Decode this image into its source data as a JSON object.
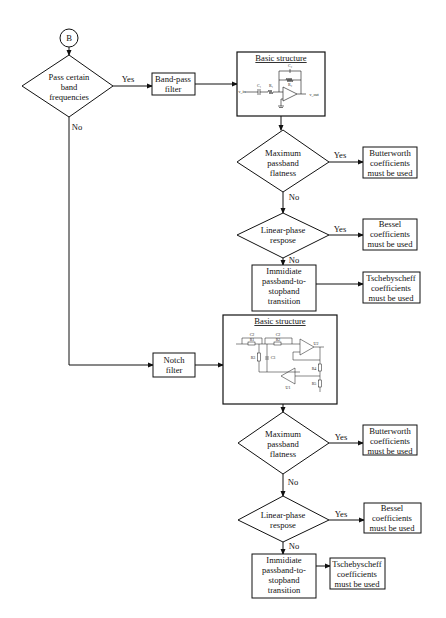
{
  "start_connector": {
    "label": "B"
  },
  "decision_main": {
    "lines": [
      "Pass certain",
      "band",
      "frequencies"
    ],
    "yes": "Yes",
    "no": "No"
  },
  "bandpass": {
    "filter": {
      "lines": [
        "Band-pass",
        "filter"
      ]
    },
    "structure": {
      "title": "Basic structure",
      "labels": {
        "c2": "C₂",
        "r2": "R₂",
        "c1": "C₁",
        "r1": "R₁",
        "vin": "v_in",
        "vout": "v_out"
      }
    },
    "decision_flat": {
      "lines": [
        "Maximum",
        "passband",
        "flatness"
      ],
      "yes": "Yes",
      "no": "No"
    },
    "result_butter": {
      "lines": [
        "Butterworth",
        "coefficients",
        "must be used"
      ]
    },
    "decision_phase": {
      "lines": [
        "Linear-phase",
        "respose"
      ],
      "yes": "Yes",
      "no": "No"
    },
    "result_bessel": {
      "lines": [
        "Bessel",
        "coefficients",
        "must be used"
      ]
    },
    "transition": {
      "lines": [
        "Immidiate",
        "passband-to-",
        "stopband",
        "transition"
      ]
    },
    "result_tscheby": {
      "lines": [
        "Tschebyscheff",
        "coefficients",
        "must be used"
      ]
    }
  },
  "notch": {
    "filter": {
      "lines": [
        "Notch",
        "filter"
      ]
    },
    "structure": {
      "title": "Basic structure",
      "labels": {
        "c2a": "C2",
        "r1": "R1",
        "c2b": "C2",
        "r2": "R2",
        "r3": "R3",
        "c3": "C3",
        "u1": "U1",
        "u2": "U2",
        "r4": "R4",
        "r5": "R5"
      }
    },
    "decision_flat": {
      "lines": [
        "Maximum",
        "passband",
        "flatness"
      ],
      "yes": "Yes",
      "no": "No"
    },
    "result_butter": {
      "lines": [
        "Butterworth",
        "coefficients",
        "must be used"
      ]
    },
    "decision_phase": {
      "lines": [
        "Linear-phase",
        "respose"
      ],
      "yes": "Yes",
      "no": "No"
    },
    "result_bessel": {
      "lines": [
        "Bessel",
        "coefficients",
        "must be used"
      ]
    },
    "transition": {
      "lines": [
        "Immidiate",
        "passband-to-",
        "stopband",
        "transition"
      ]
    },
    "result_tscheby": {
      "lines": [
        "Tschebyscheff",
        "coefficients",
        "must be used"
      ]
    }
  }
}
